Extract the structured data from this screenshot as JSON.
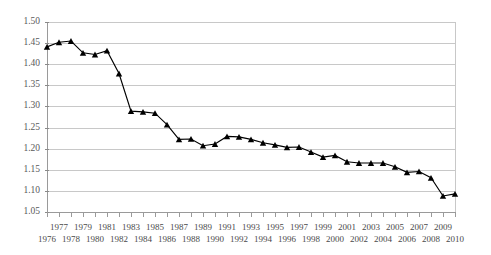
{
  "chart_data": {
    "type": "line",
    "title": "",
    "subtitle": "",
    "xlabel": "",
    "ylabel": "",
    "grid": true,
    "legend": false,
    "legend_position": "none",
    "marker": "triangle",
    "line_color": "#000000",
    "grid_color": "#c8c8c8",
    "xlim": [
      1976,
      2010
    ],
    "ylim": [
      1.05,
      1.5
    ],
    "yticks": [
      1.05,
      1.1,
      1.15,
      1.2,
      1.25,
      1.3,
      1.35,
      1.4,
      1.45,
      1.5
    ],
    "ytick_labels": [
      "1.05",
      "1.10",
      "1.15",
      "1.20",
      "1.25",
      "1.30",
      "1.35",
      "1.40",
      "1.45",
      "1.50"
    ],
    "xticks": [
      1976,
      1977,
      1978,
      1979,
      1980,
      1981,
      1982,
      1983,
      1984,
      1985,
      1986,
      1987,
      1988,
      1989,
      1990,
      1991,
      1992,
      1993,
      1994,
      1995,
      1996,
      1997,
      1998,
      1999,
      2000,
      2001,
      2002,
      2003,
      2004,
      2005,
      2006,
      2007,
      2008,
      2009,
      2010
    ],
    "xtick_labels_upper": [
      "",
      "1977",
      "",
      "1979",
      "",
      "1981",
      "",
      "1983",
      "",
      "1985",
      "",
      "1987",
      "",
      "1989",
      "",
      "1991",
      "",
      "1993",
      "",
      "1995",
      "",
      "1997",
      "",
      "1999",
      "",
      "2001",
      "",
      "2003",
      "",
      "2005",
      "",
      "2007",
      "",
      "2009",
      ""
    ],
    "xtick_labels_lower": [
      "1976",
      "",
      "1978",
      "",
      "1980",
      "",
      "1982",
      "",
      "1984",
      "",
      "1986",
      "",
      "1988",
      "",
      "1990",
      "",
      "1992",
      "",
      "1994",
      "",
      "1996",
      "",
      "1998",
      "",
      "2000",
      "",
      "2002",
      "",
      "2004",
      "",
      "2006",
      "",
      "2008",
      "",
      "2010"
    ],
    "categories": [
      1976,
      1977,
      1978,
      1979,
      1980,
      1981,
      1982,
      1983,
      1984,
      1985,
      1986,
      1987,
      1988,
      1989,
      1990,
      1991,
      1992,
      1993,
      1994,
      1995,
      1996,
      1997,
      1998,
      1999,
      2000,
      2001,
      2002,
      2003,
      2004,
      2005,
      2006,
      2007,
      2008,
      2009,
      2010
    ],
    "values": [
      1.441,
      1.452,
      1.455,
      1.427,
      1.423,
      1.432,
      1.378,
      1.289,
      1.287,
      1.284,
      1.257,
      1.222,
      1.223,
      1.207,
      1.211,
      1.229,
      1.228,
      1.222,
      1.214,
      1.209,
      1.203,
      1.204,
      1.192,
      1.18,
      1.184,
      1.169,
      1.166,
      1.166,
      1.166,
      1.157,
      1.144,
      1.146,
      1.131,
      1.088,
      1.093
    ]
  }
}
